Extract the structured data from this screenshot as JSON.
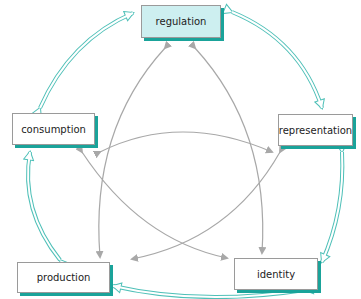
{
  "diagram": {
    "colors": {
      "outer_arrow": "#4fc0b8",
      "inner_arrow": "#a8a8a8",
      "shadow": "#1aa39a",
      "highlight_fill": "#cdeff0"
    },
    "nodes": [
      {
        "id": "regulation",
        "label": "regulation",
        "highlighted": true
      },
      {
        "id": "representation",
        "label": "representation",
        "highlighted": false
      },
      {
        "id": "identity",
        "label": "identity",
        "highlighted": false
      },
      {
        "id": "production",
        "label": "production",
        "highlighted": false
      },
      {
        "id": "consumption",
        "label": "consumption",
        "highlighted": false
      }
    ],
    "outer_links": [
      [
        "regulation",
        "representation"
      ],
      [
        "representation",
        "identity"
      ],
      [
        "identity",
        "production"
      ],
      [
        "production",
        "consumption"
      ],
      [
        "consumption",
        "regulation"
      ]
    ],
    "inner_links": [
      [
        "regulation",
        "production"
      ],
      [
        "regulation",
        "identity"
      ],
      [
        "consumption",
        "representation"
      ],
      [
        "consumption",
        "identity"
      ],
      [
        "representation",
        "production"
      ]
    ]
  }
}
